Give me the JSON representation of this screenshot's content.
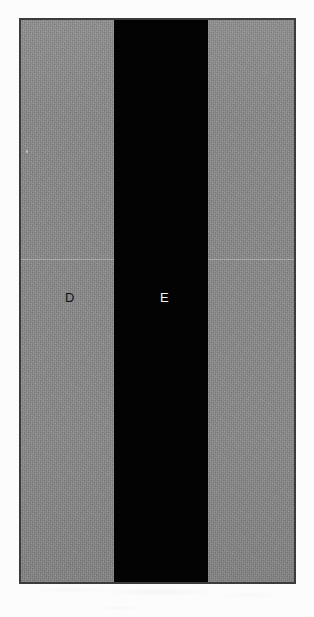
{
  "figure": {
    "caption": "",
    "frame": {
      "border_color": "#3c3c3c",
      "background_color": "#fcfcfc"
    },
    "regions": [
      {
        "id": "matrix-left",
        "label": "D",
        "label_color": "#121212",
        "fill_color": "#8b8b8b",
        "description": "light gray matrix region on the left"
      },
      {
        "id": "band",
        "label": "E",
        "label_color": "#f2f2f2",
        "fill_color": "#030303",
        "description": "dark vertical band through the center"
      },
      {
        "id": "matrix-right",
        "label": "",
        "label_color": "",
        "fill_color": "#8b8b8b",
        "description": "light gray matrix region on the right"
      }
    ],
    "markers": {
      "seam": "horizontal stitching seam",
      "specks": "bright specks in dark band"
    }
  }
}
